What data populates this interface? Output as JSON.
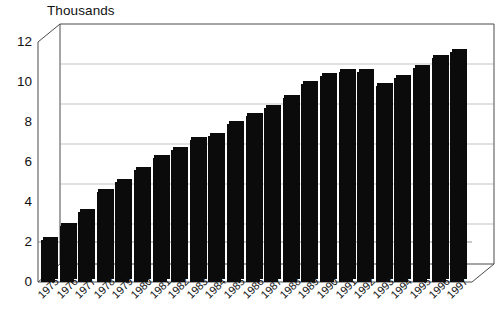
{
  "chart_data": {
    "type": "bar",
    "title": "Thousands",
    "xlabel": "",
    "ylabel": "",
    "ylim": [
      0,
      12
    ],
    "yticks": [
      0,
      2,
      4,
      6,
      8,
      10,
      12
    ],
    "grid": true,
    "legend": "none",
    "style": "3d-column",
    "bar_color": "#0b0b0b",
    "categories": [
      "1975",
      "1976",
      "1977",
      "1978",
      "1979",
      "1980",
      "1981",
      "1982",
      "1983",
      "1984",
      "1985",
      "1986",
      "1987",
      "1988",
      "1989",
      "1990",
      "1991",
      "1992",
      "1993",
      "1994",
      "1995",
      "1996",
      "1997"
    ],
    "values": [
      2.1,
      2.8,
      3.5,
      4.5,
      5.0,
      5.6,
      6.2,
      6.6,
      7.1,
      7.3,
      7.9,
      8.3,
      8.7,
      9.2,
      9.9,
      10.3,
      10.5,
      10.5,
      9.8,
      10.2,
      10.7,
      11.2,
      11.5
    ],
    "annotations": [
      "Dip at 1993 relative to 1992",
      "Steady growth 1975-1992",
      "Peak at 1997"
    ]
  },
  "axes": {
    "y_tick_labels": [
      "12",
      "10",
      "8",
      "6",
      "4",
      "2",
      "0"
    ]
  }
}
